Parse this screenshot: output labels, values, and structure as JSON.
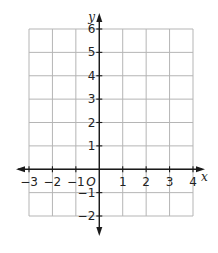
{
  "chart_data": {
    "type": "scatter",
    "title": "",
    "xlabel": "x",
    "ylabel": "y",
    "origin_label": "O",
    "xlim": [
      -3,
      4
    ],
    "ylim": [
      -2,
      6
    ],
    "grid": true,
    "x_ticks": [
      -3,
      -2,
      -1,
      1,
      2,
      3,
      4
    ],
    "y_ticks": [
      6,
      5,
      4,
      3,
      2,
      1,
      -1,
      -2
    ],
    "x_tick_labels": [
      "−3",
      "−2",
      "−1",
      "1",
      "2",
      "3",
      "4"
    ],
    "y_tick_labels": [
      "6",
      "5",
      "4",
      "3",
      "2",
      "1",
      "−1",
      "−2"
    ],
    "points": []
  }
}
